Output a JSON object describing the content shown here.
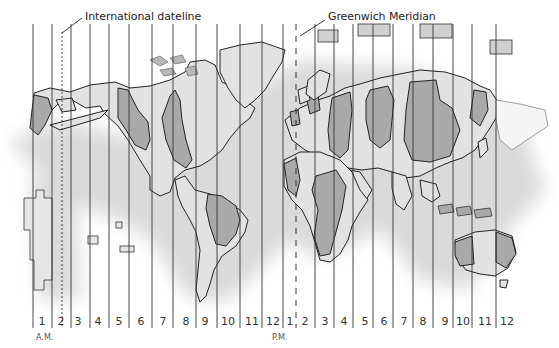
{
  "title_labels": {
    "dateline": "International dateline",
    "meridian": "Greenwich Meridian"
  },
  "time_labels": {
    "am": "A.M.",
    "pm": "P.M."
  },
  "zones_am": [
    "1",
    "2",
    "3",
    "4",
    "5",
    "6",
    "7",
    "8",
    "9",
    "10",
    "11",
    "12"
  ],
  "zones_pm": [
    "1",
    "2",
    "3",
    "4",
    "5",
    "6",
    "7",
    "8",
    "9",
    "10",
    "11",
    "12"
  ],
  "colors": {
    "land_light": "#e2e2e2",
    "land_dark": "#a9a9a9",
    "line": "#333333",
    "shadow": "#d8d8d8",
    "background": "#ffffff"
  }
}
